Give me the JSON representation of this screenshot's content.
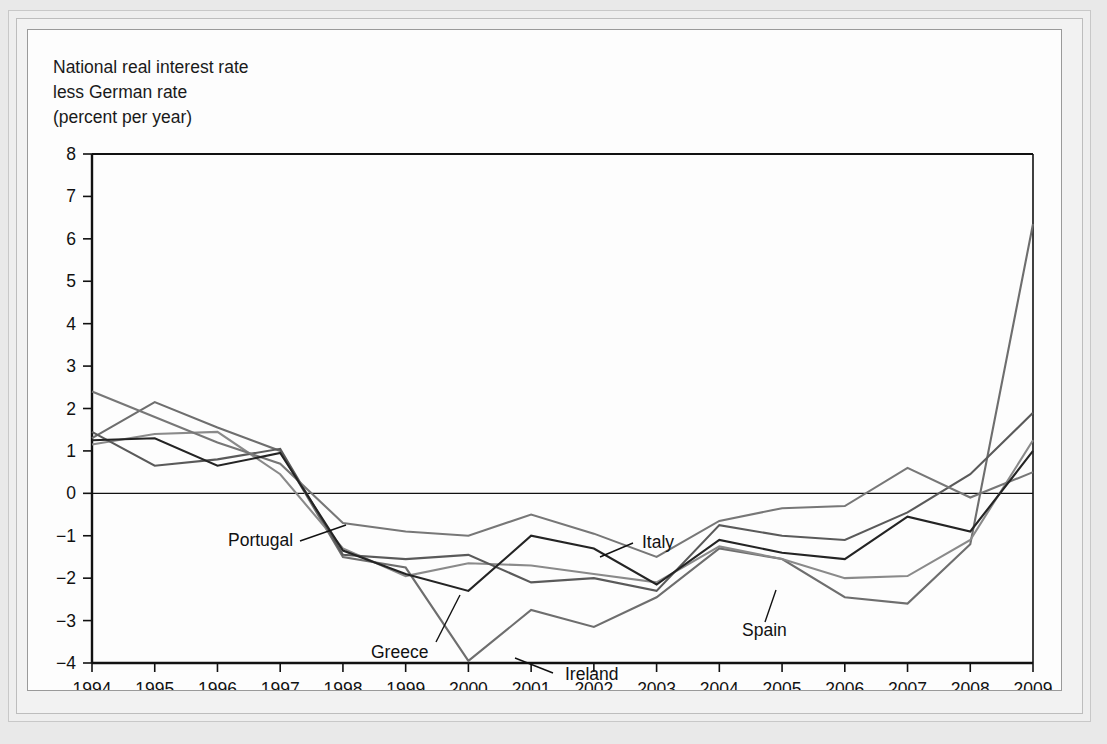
{
  "figure": {
    "axis_title_lines": [
      "National real interest rate",
      "less German rate",
      "(percent per year)"
    ]
  },
  "chart_data": {
    "type": "line",
    "title": "National real interest rate less German rate (percent per year)",
    "xlabel": "",
    "ylabel": "National real interest rate less German rate (percent per year)",
    "xlim": [
      1994,
      2009
    ],
    "ylim": [
      -4,
      8
    ],
    "yticks": [
      8,
      7,
      6,
      5,
      4,
      3,
      2,
      1,
      0,
      -1,
      -2,
      -3,
      -4
    ],
    "ytick_labels": [
      "8",
      "7",
      "6",
      "5",
      "4",
      "3",
      "2",
      "1",
      "0",
      "−1",
      "−2",
      "−3",
      "−4"
    ],
    "x": [
      1994,
      1995,
      1996,
      1997,
      1998,
      1999,
      2000,
      2001,
      2002,
      2003,
      2004,
      2005,
      2006,
      2007,
      2008,
      2009
    ],
    "xtick_labels": [
      "1994",
      "1995",
      "1996",
      "1997",
      "1998",
      "1999",
      "2000",
      "2001",
      "2002",
      "2003",
      "2004",
      "2005",
      "2006",
      "2007",
      "2008",
      "2009"
    ],
    "grid": false,
    "legend": "inline-annotations",
    "zero_line": true,
    "series": [
      {
        "name": "Ireland",
        "color": "#6e6e6e",
        "values": [
          1.3,
          2.15,
          1.55,
          1.0,
          -1.5,
          -1.75,
          -3.95,
          -2.75,
          -3.15,
          -2.45,
          -1.3,
          -1.55,
          -2.45,
          -2.6,
          -1.2,
          6.35
        ]
      },
      {
        "name": "Greece",
        "color": "#8a8a8a",
        "values": [
          1.15,
          1.4,
          1.45,
          0.45,
          -1.3,
          -1.95,
          -1.65,
          -1.7,
          -1.9,
          -2.1,
          -1.25,
          -1.55,
          -2.0,
          -1.95,
          -1.1,
          1.25
        ]
      },
      {
        "name": "Portugal",
        "color": "#5a5a5a",
        "values": [
          1.45,
          0.65,
          0.8,
          1.05,
          -1.45,
          -1.55,
          -1.45,
          -2.1,
          -2.0,
          -2.3,
          -0.75,
          -1.0,
          -1.1,
          -0.45,
          0.45,
          1.9
        ]
      },
      {
        "name": "Italy",
        "color": "#777777",
        "values": [
          2.4,
          1.8,
          1.2,
          0.7,
          -0.7,
          -0.9,
          -1.0,
          -0.5,
          -0.95,
          -1.5,
          -0.65,
          -0.35,
          -0.3,
          0.6,
          -0.1,
          0.5
        ]
      },
      {
        "name": "Spain",
        "color": "#242424",
        "values": [
          1.25,
          1.3,
          0.65,
          0.95,
          -1.35,
          -1.9,
          -2.3,
          -1.0,
          -1.3,
          -2.15,
          -1.1,
          -1.4,
          -1.55,
          -0.55,
          -0.9,
          1.0
        ]
      }
    ],
    "annotations": [
      {
        "label": "Portugal",
        "text_x": 200,
        "text_y": 516,
        "leader": [
          [
            272,
            511
          ],
          [
            318,
            495
          ]
        ]
      },
      {
        "label": "Greece",
        "text_x": 343,
        "text_y": 628,
        "leader": [
          [
            408,
            612
          ],
          [
            432,
            565
          ]
        ]
      },
      {
        "label": "Ireland",
        "text_x": 537,
        "text_y": 650,
        "leader": [
          [
            525,
            643
          ],
          [
            487,
            628
          ]
        ]
      },
      {
        "label": "Italy",
        "text_x": 614,
        "text_y": 518,
        "leader": [
          [
            605,
            513
          ],
          [
            572,
            527
          ]
        ]
      },
      {
        "label": "Spain",
        "text_x": 714,
        "text_y": 606,
        "leader": [
          [
            737,
            592
          ],
          [
            748,
            560
          ]
        ]
      }
    ]
  }
}
